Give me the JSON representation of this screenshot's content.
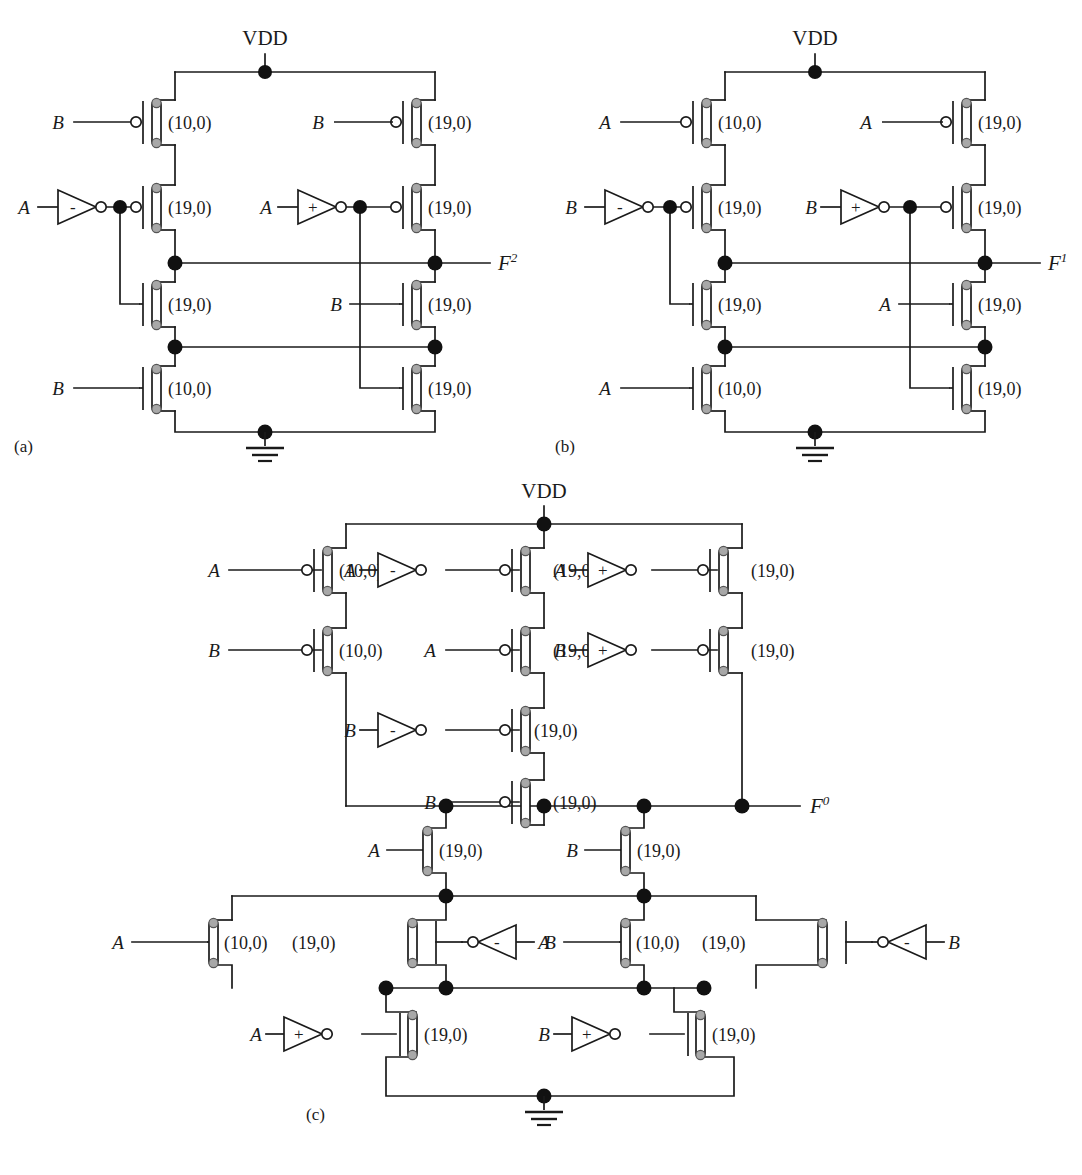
{
  "figure": {
    "panels": [
      {
        "id": "a",
        "caption": "(a)",
        "supply_label": "VDD",
        "ground": "gnd",
        "output": {
          "name": "F",
          "superscript": "2",
          "full": "F2"
        },
        "transistors": [
          {
            "ref": "a-p1",
            "type": "pmos",
            "size": "(10,0)",
            "gate_label": "B",
            "gate_source": "direct"
          },
          {
            "ref": "a-p2",
            "type": "pmos",
            "size": "(19,0)",
            "gate_label": "A",
            "gate_source": "inverter-minus"
          },
          {
            "ref": "a-n1",
            "type": "nmos",
            "size": "(19,0)",
            "gate_label": "",
            "gate_source": "node-a-left"
          },
          {
            "ref": "a-n2",
            "type": "nmos",
            "size": "(10,0)",
            "gate_label": "B",
            "gate_source": "direct"
          },
          {
            "ref": "a-p3",
            "type": "pmos",
            "size": "(19,0)",
            "gate_label": "B",
            "gate_source": "direct"
          },
          {
            "ref": "a-p4",
            "type": "pmos",
            "size": "(19,0)",
            "gate_label": "A",
            "gate_source": "inverter-plus"
          },
          {
            "ref": "a-n3",
            "type": "nmos",
            "size": "(19,0)",
            "gate_label": "B",
            "gate_source": "direct"
          },
          {
            "ref": "a-n4",
            "type": "nmos",
            "size": "(19,0)",
            "gate_label": "",
            "gate_source": "node-a-right"
          }
        ],
        "gates": [
          {
            "ref": "a-inv-left",
            "sign": "-",
            "input": "A",
            "dir": "right"
          },
          {
            "ref": "a-inv-right",
            "sign": "+",
            "input": "A",
            "dir": "right"
          }
        ]
      },
      {
        "id": "b",
        "caption": "(b)",
        "supply_label": "VDD",
        "ground": "gnd",
        "output": {
          "name": "F",
          "superscript": "1",
          "full": "F1"
        },
        "transistors": [
          {
            "ref": "b-p1",
            "type": "pmos",
            "size": "(10,0)",
            "gate_label": "A",
            "gate_source": "direct"
          },
          {
            "ref": "b-p2",
            "type": "pmos",
            "size": "(19,0)",
            "gate_label": "B",
            "gate_source": "inverter-minus"
          },
          {
            "ref": "b-n1",
            "type": "nmos",
            "size": "(19,0)",
            "gate_label": "",
            "gate_source": "node-b-left"
          },
          {
            "ref": "b-n2",
            "type": "nmos",
            "size": "(10,0)",
            "gate_label": "A",
            "gate_source": "direct"
          },
          {
            "ref": "b-p3",
            "type": "pmos",
            "size": "(19,0)",
            "gate_label": "A",
            "gate_source": "direct"
          },
          {
            "ref": "b-p4",
            "type": "pmos",
            "size": "(19,0)",
            "gate_label": "B",
            "gate_source": "inverter-plus"
          },
          {
            "ref": "b-n3",
            "type": "nmos",
            "size": "(19,0)",
            "gate_label": "A",
            "gate_source": "direct"
          },
          {
            "ref": "b-n4",
            "type": "nmos",
            "size": "(19,0)",
            "gate_label": "",
            "gate_source": "node-b-right"
          }
        ],
        "gates": [
          {
            "ref": "b-inv-left",
            "sign": "-",
            "input": "B",
            "dir": "right"
          },
          {
            "ref": "b-inv-right",
            "sign": "+",
            "input": "B",
            "dir": "right"
          }
        ]
      },
      {
        "id": "c",
        "caption": "(c)",
        "supply_label": "VDD",
        "ground": "gnd",
        "output": {
          "name": "F",
          "superscript": "0",
          "full": "F0"
        },
        "transistors": [
          {
            "ref": "c-p1",
            "type": "pmos",
            "size": "(10,0)",
            "gate_label": "A",
            "gate_source": "direct"
          },
          {
            "ref": "c-p2",
            "type": "pmos",
            "size": "(10,0)",
            "gate_label": "B",
            "gate_source": "direct"
          },
          {
            "ref": "c-p3",
            "type": "pmos",
            "size": "(19,0)",
            "gate_label": "A",
            "gate_source": "inverter-minus"
          },
          {
            "ref": "c-p4",
            "type": "pmos",
            "size": "(19,0)",
            "gate_label": "A",
            "gate_source": "direct"
          },
          {
            "ref": "c-p5",
            "type": "pmos",
            "size": "(19,0)",
            "gate_label": "B",
            "gate_source": "inverter-minus"
          },
          {
            "ref": "c-p6",
            "type": "pmos",
            "size": "(19,0)",
            "gate_label": "B",
            "gate_source": "direct"
          },
          {
            "ref": "c-p7",
            "type": "pmos",
            "size": "(19,0)",
            "gate_label": "A",
            "gate_source": "inverter-plus"
          },
          {
            "ref": "c-p8",
            "type": "pmos",
            "size": "(19,0)",
            "gate_label": "B",
            "gate_source": "inverter-plus"
          },
          {
            "ref": "c-n1",
            "type": "nmos",
            "size": "(19,0)",
            "gate_label": "A",
            "gate_source": "direct"
          },
          {
            "ref": "c-n2",
            "type": "nmos",
            "size": "(19,0)",
            "gate_label": "B",
            "gate_source": "direct"
          },
          {
            "ref": "c-n3",
            "type": "nmos",
            "size": "(10,0)",
            "gate_label": "A",
            "gate_source": "direct"
          },
          {
            "ref": "c-n4",
            "type": "nmos",
            "size": "(19,0)",
            "gate_label": "A",
            "gate_source": "inverter-minus-rev"
          },
          {
            "ref": "c-n5",
            "type": "nmos",
            "size": "(10,0)",
            "gate_label": "B",
            "gate_source": "direct"
          },
          {
            "ref": "c-n6",
            "type": "nmos",
            "size": "(19,0)",
            "gate_label": "B",
            "gate_source": "inverter-minus-rev"
          },
          {
            "ref": "c-n7",
            "type": "nmos",
            "size": "(19,0)",
            "gate_label": "A",
            "gate_source": "inverter-plus"
          },
          {
            "ref": "c-n8",
            "type": "nmos",
            "size": "(19,0)",
            "gate_label": "B",
            "gate_source": "inverter-plus"
          }
        ],
        "gates": [
          {
            "ref": "c-inv-1",
            "sign": "-",
            "input": "A",
            "dir": "right"
          },
          {
            "ref": "c-inv-2",
            "sign": "+",
            "input": "A",
            "dir": "right"
          },
          {
            "ref": "c-inv-3",
            "sign": "-",
            "input": "B",
            "dir": "right"
          },
          {
            "ref": "c-inv-4",
            "sign": "+",
            "input": "B",
            "dir": "right"
          },
          {
            "ref": "c-inv-5",
            "sign": "-",
            "input": "A",
            "dir": "left"
          },
          {
            "ref": "c-inv-6",
            "sign": "-",
            "input": "B",
            "dir": "left"
          },
          {
            "ref": "c-inv-7",
            "sign": "+",
            "input": "A",
            "dir": "right"
          },
          {
            "ref": "c-inv-8",
            "sign": "+",
            "input": "B",
            "dir": "right"
          }
        ]
      }
    ],
    "sizes_used": [
      "(10,0)",
      "(19,0)"
    ],
    "signal_names": [
      "A",
      "B"
    ],
    "colors": {
      "wire": "#1a1a1a",
      "text": "#1a1a1a",
      "node_fill": "#111111",
      "terminal_fill": "#a8a8a8",
      "terminal_stroke": "#555555",
      "background": "#ffffff"
    },
    "panel_a": {
      "vdd": "VDD",
      "caption": "(a)",
      "out_name": "F",
      "out_sup": "2",
      "t1_size": "(10,0)",
      "t1_gate": "B",
      "t2_size": "(19,0)",
      "t2_gate": "A",
      "t2_sign": "-",
      "t3_size": "(19,0)",
      "t4_size": "(10,0)",
      "t4_gate": "B",
      "t5_size": "(19,0)",
      "t5_gate": "B",
      "t6_size": "(19,0)",
      "t6_gate": "A",
      "t6_sign": "+",
      "t7_size": "(19,0)",
      "t7_gate": "B",
      "t8_size": "(19,0)"
    },
    "panel_b": {
      "vdd": "VDD",
      "caption": "(b)",
      "out_name": "F",
      "out_sup": "1",
      "t1_size": "(10,0)",
      "t1_gate": "A",
      "t2_size": "(19,0)",
      "t2_gate": "B",
      "t2_sign": "-",
      "t3_size": "(19,0)",
      "t4_size": "(10,0)",
      "t4_gate": "A",
      "t5_size": "(19,0)",
      "t5_gate": "A",
      "t6_size": "(19,0)",
      "t6_gate": "B",
      "t6_sign": "+",
      "t7_size": "(19,0)",
      "t7_gate": "A",
      "t8_size": "(19,0)"
    },
    "panel_c": {
      "vdd": "VDD",
      "caption": "(c)",
      "out_name": "F",
      "out_sup": "0",
      "p1_size": "(10,0)",
      "p1_gate": "A",
      "p2_size": "(10,0)",
      "p2_gate": "B",
      "p3_size": "(19,0)",
      "p3_gate": "A",
      "p3_sign": "-",
      "p4_size": "(19,0)",
      "p4_gate": "A",
      "p5_size": "(19,0)",
      "p5_gate": "B",
      "p5_sign": "-",
      "p6_size": "(19,0)",
      "p6_gate": "B",
      "p7_size": "(19,0)",
      "p7_gate": "A",
      "p7_sign": "+",
      "p8_size": "(19,0)",
      "p8_gate": "B",
      "p8_sign": "+",
      "n1_size": "(19,0)",
      "n1_gate": "A",
      "n2_size": "(19,0)",
      "n2_gate": "B",
      "n3_size": "(10,0)",
      "n3_gate": "A",
      "n4_size": "(19,0)",
      "n4_gate": "A",
      "n4_sign": "-",
      "n5_size": "(10,0)",
      "n5_gate": "B",
      "n6_size": "(19,0)",
      "n6_gate": "B",
      "n6_sign": "-",
      "n7_size": "(19,0)",
      "n7_gate": "A",
      "n7_sign": "+",
      "n8_size": "(19,0)",
      "n8_gate": "B",
      "n8_sign": "+"
    }
  }
}
